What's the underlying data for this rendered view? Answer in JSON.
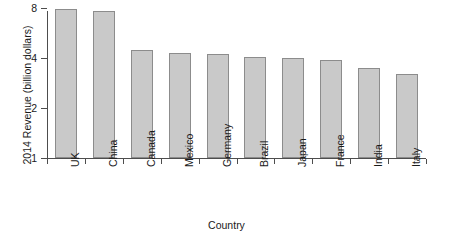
{
  "chart_data": {
    "type": "bar",
    "title": "",
    "xlabel": "Country",
    "ylabel": "2014 Revenue (billion dollars)",
    "categories": [
      "UK",
      "China",
      "Canada",
      "Mexico",
      "Germany",
      "Brazil",
      "Japan",
      "France",
      "India",
      "Italy"
    ],
    "values": [
      7.9,
      7.7,
      4.5,
      4.3,
      4.25,
      4.05,
      4.0,
      3.9,
      3.5,
      3.2
    ],
    "series": [
      {
        "name": "2014 Revenue",
        "values": [
          7.9,
          7.7,
          4.5,
          4.3,
          4.25,
          4.05,
          4.0,
          3.9,
          3.5,
          3.2
        ]
      }
    ],
    "yscale": "log2",
    "ylim": [
      1,
      8.6
    ],
    "ytick_labels": [
      "8",
      "4",
      "2",
      "1"
    ],
    "ytick_values": [
      8,
      4,
      2,
      1
    ],
    "grid": false,
    "legend": null,
    "bar_fill_color": "#c9c9c9",
    "bar_edge_color": "#8c8c8c",
    "axis_color": "#4d4d4d",
    "background_color": "#ffffff",
    "xtick_label_rotation": 90
  }
}
